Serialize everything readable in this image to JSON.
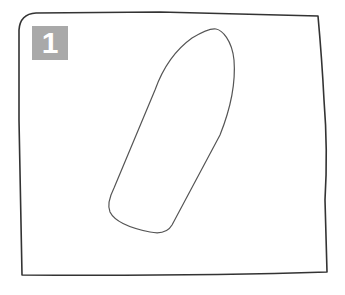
{
  "figure": {
    "type": "step-illustration",
    "step_badge": {
      "label": "1",
      "background_color": "#a9a9a9",
      "text_color": "#ffffff"
    },
    "sheet": {
      "description": "irregular rectangular sheet outline",
      "stroke_color": "#333333"
    },
    "shape": {
      "description": "elongated pointed oval (boat / ski pattern) drawn diagonally on sheet",
      "stroke_color": "#555555"
    }
  }
}
